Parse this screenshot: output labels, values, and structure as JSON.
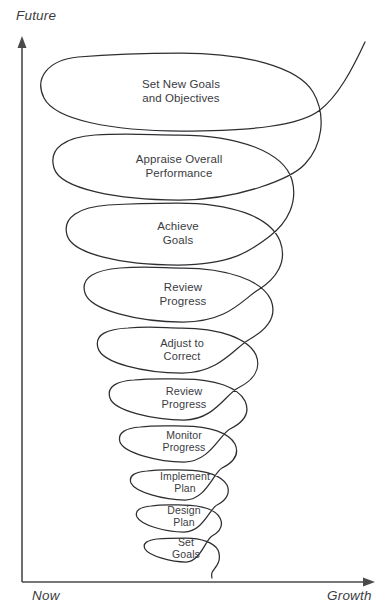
{
  "diagram": {
    "kind": "descending-growth-spiral",
    "axes": {
      "vertical_label": "Future",
      "origin_label": "Now",
      "horizontal_label": "Growth"
    },
    "colors": {
      "spiral_stroke": "#2e2e32",
      "axis_stroke": "#4a4a4a",
      "text": "#3b3b3f",
      "background": "#ffffff"
    },
    "stages": [
      {
        "index": 1,
        "label": "Set New Goals\nand Objectives",
        "cx": 181,
        "cy": 92,
        "rx": 139,
        "ry": 39,
        "font_size": 11.5
      },
      {
        "index": 2,
        "label": "Appraise Overall\nPerformance",
        "cx": 179,
        "cy": 167,
        "rx": 126,
        "ry": 33,
        "font_size": 11.5
      },
      {
        "index": 3,
        "label": "Achieve\nGoals",
        "cx": 178,
        "cy": 234,
        "rx": 112,
        "ry": 31,
        "font_size": 11.5
      },
      {
        "index": 4,
        "label": "Review\nProgress",
        "cx": 183,
        "cy": 295,
        "rx": 99,
        "ry": 27,
        "font_size": 11.5
      },
      {
        "index": 5,
        "label": "Adjust to\nCorrect",
        "cx": 182,
        "cy": 350,
        "rx": 85,
        "ry": 23,
        "font_size": 11
      },
      {
        "index": 6,
        "label": "Review\nProgress",
        "cx": 184,
        "cy": 398,
        "rx": 74,
        "ry": 22,
        "font_size": 11
      },
      {
        "index": 7,
        "label": "Monitor\nProgress",
        "cx": 184,
        "cy": 441,
        "rx": 64,
        "ry": 20,
        "font_size": 10.5
      },
      {
        "index": 8,
        "label": "Implement\nPlan",
        "cx": 185,
        "cy": 482,
        "rx": 55,
        "ry": 18,
        "font_size": 10.5
      },
      {
        "index": 9,
        "label": "Design\nPlan",
        "cx": 184,
        "cy": 516,
        "rx": 47,
        "ry": 16,
        "font_size": 10.5
      },
      {
        "index": 10,
        "label": "Set\nGoals",
        "cx": 186,
        "cy": 548,
        "rx": 41,
        "ry": 14,
        "font_size": 10.5
      }
    ]
  }
}
